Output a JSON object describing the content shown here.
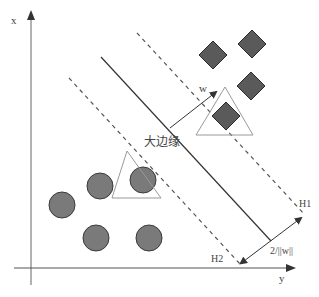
{
  "diagram": {
    "axes": {
      "vertical_label": "x",
      "horizontal_label": "y",
      "axis_color": "#999999"
    },
    "lines": {
      "hyperplane": {
        "x1": 101,
        "y1": 57,
        "x2": 271,
        "y2": 241
      },
      "h1": {
        "label": "H1",
        "x1": 137,
        "y1": 33,
        "x2": 305,
        "y2": 215
      },
      "h2": {
        "label": "H2",
        "x1": 69,
        "y1": 78,
        "x2": 240,
        "y2": 264
      }
    },
    "labels": {
      "margin": "大边缘",
      "w_vector": "w",
      "margin_width": "2/||w||",
      "h1": "H1",
      "h2": "H2"
    },
    "colors": {
      "shape_fill": "#7a7a7a",
      "diamond_fill": "#5a5a5a",
      "shape_stroke": "#3a3a3a",
      "line": "#333333",
      "dashed": "#555555",
      "triangle_stroke": "#999999"
    },
    "circles": [
      {
        "cx": 62,
        "cy": 205
      },
      {
        "cx": 100,
        "cy": 186
      },
      {
        "cx": 143,
        "cy": 180
      },
      {
        "cx": 96,
        "cy": 238
      },
      {
        "cx": 149,
        "cy": 238
      }
    ],
    "diamonds": [
      {
        "cx": 213,
        "cy": 55
      },
      {
        "cx": 252,
        "cy": 44
      },
      {
        "cx": 251,
        "cy": 86
      },
      {
        "cx": 226,
        "cy": 116
      }
    ],
    "triangles": [
      {
        "points": "127,151 112,198 161,198"
      },
      {
        "points": "225,87 196,135 253,135"
      }
    ],
    "support_vectors_note": "circle and diamond enclosed by triangles"
  }
}
